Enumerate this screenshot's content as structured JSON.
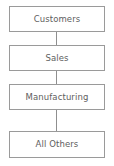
{
  "diagram": {
    "type": "vertical-flowchart",
    "orientation": "top-to-bottom",
    "background_color": "#ffffff",
    "border_color": "#9a9a9a",
    "text_color": "#5e5e5e",
    "nodes": [
      {
        "id": "customers",
        "label": "Customers"
      },
      {
        "id": "sales",
        "label": "Sales"
      },
      {
        "id": "manufacturing",
        "label": "Manufacturing"
      },
      {
        "id": "all-others",
        "label": "All Others"
      }
    ],
    "connectors": [
      {
        "from": "customers",
        "to": "sales"
      },
      {
        "from": "sales",
        "to": "manufacturing"
      },
      {
        "from": "manufacturing",
        "to": "all-others"
      }
    ]
  }
}
